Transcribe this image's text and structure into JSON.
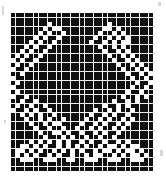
{
  "chart_data": {
    "type": "heatmap",
    "title": "",
    "xlabel": "",
    "ylabel": "",
    "grid": {
      "columns": 31,
      "rows": 35,
      "cell_size_px": 4.55,
      "gridline_color": "#f4f4f4",
      "filled_color": "#101010",
      "empty_color": "#ffffff",
      "filled_symbol": "1",
      "empty_symbol": "0"
    },
    "legend": [
      {
        "symbol": "1",
        "label": "filled",
        "color": "#101010"
      },
      {
        "symbol": "0",
        "label": "empty",
        "color": "#ffffff"
      }
    ],
    "rows_data": [
      "1111111111111111111111111111111",
      "1111111111111111111111111111111",
      "1111111101111111111110111111111",
      "1111111010011111111100101111111",
      "1111110101101111111011010111111",
      "1111101011011111110110101011111",
      "1111010110111111101101010011111",
      "1110101101111111111011010111111",
      "1101011011111111111101101011111",
      "1010110111111111111110110101111",
      "0101101111111111111111011010111",
      "1011011111111111111111101101011",
      "0110111111111111111111110110101",
      "1101111111111111111111111011010",
      "0111111111111111111111111101101",
      "1011111111111111111111111110110",
      "0111111111111111111111111101101",
      "1011111111111111111111111011011",
      "0110111111111111111111110110101",
      "1101101111111111111111011010111",
      "1011011011111111111101101011111",
      "0110101101111111110110101101111",
      "1101010110111111101101011011111",
      "1110110101101111011010110101111",
      "1111011010011110110101101011111",
      "1111101101101101101011010111111",
      "1111110110010110110101101111111",
      "1111111011101011011011011111111",
      "1111010101010110101101101011111",
      "1100101011010101011010010100111",
      "1001010110101010110100101001011",
      "1010101101011011010011010100101",
      "1100011000110011000110001100011",
      "1111111111111111111111111111111",
      "1111111111111111111111111111111"
    ]
  },
  "page": {
    "background_color": "#ffffff",
    "image_width": 166,
    "image_height": 176
  },
  "specks": [
    {
      "x": 2,
      "y": 6,
      "w": 2,
      "h": 9
    },
    {
      "x": 158,
      "y": 2,
      "w": 3,
      "h": 4
    },
    {
      "x": 4,
      "y": 120,
      "w": 2,
      "h": 3
    },
    {
      "x": 160,
      "y": 150,
      "w": 3,
      "h": 6
    }
  ]
}
